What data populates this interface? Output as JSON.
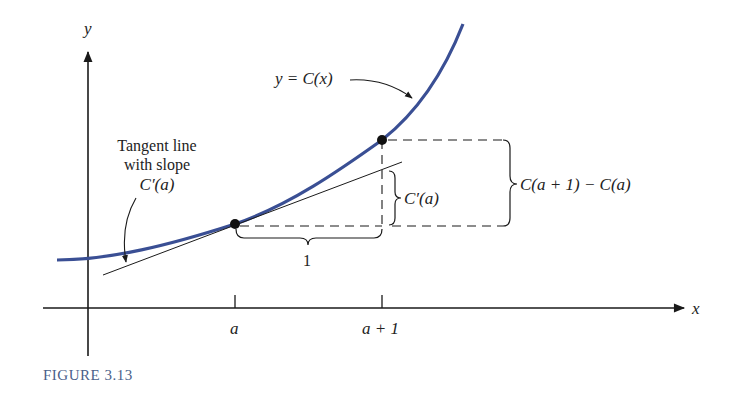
{
  "figure": {
    "caption": "FIGURE 3.13",
    "axes": {
      "x_label": "x",
      "y_label": "y"
    },
    "ticks": [
      {
        "label": "a"
      },
      {
        "label": "a + 1"
      }
    ],
    "curve_label": "y = C(x)",
    "tangent_annotation": {
      "line1": "Tangent line",
      "line2": "with slope",
      "line3": "C′(a)"
    },
    "run_label": "1",
    "rise_tangent_label": "C′(a)",
    "rise_curve_label": "C(a + 1) − C(a)",
    "colors": {
      "curve": "#3a4f94",
      "ink": "#1a1a1a",
      "caption": "#4a5f8a"
    }
  }
}
